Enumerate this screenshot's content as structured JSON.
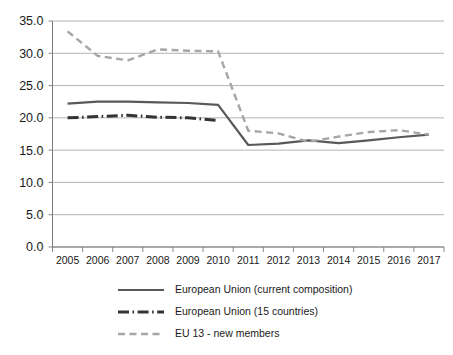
{
  "chart_data": {
    "type": "line",
    "title": "",
    "subtitle": "",
    "xlabel": "",
    "ylabel": "",
    "categories": [
      "2005",
      "2006",
      "2007",
      "2008",
      "2009",
      "2010",
      "2011",
      "2012",
      "2013",
      "2014",
      "2015",
      "2016",
      "2017"
    ],
    "x": [
      2005,
      2006,
      2007,
      2008,
      2009,
      2010,
      2011,
      2012,
      2013,
      2014,
      2015,
      2016,
      2017
    ],
    "ylim": [
      0.0,
      35.0
    ],
    "ytick_values": [
      0.0,
      5.0,
      10.0,
      15.0,
      20.0,
      25.0,
      30.0,
      35.0
    ],
    "ytick_labels": [
      "0.0",
      "5.0",
      "10.0",
      "15.0",
      "20.0",
      "25.0",
      "30.0",
      "35.0"
    ],
    "grid": true,
    "legend_position": "bottom",
    "series": [
      {
        "name": "European Union (current composition)",
        "color": "#595959",
        "style": "solid",
        "values": [
          22.2,
          22.5,
          22.5,
          22.4,
          22.3,
          22.0,
          15.8,
          16.0,
          16.5,
          16.1,
          16.5,
          17.0,
          17.4
        ]
      },
      {
        "name": "European Union (15 countries)",
        "color": "#333333",
        "style": "dash-dot",
        "values": [
          20.0,
          20.2,
          20.4,
          20.1,
          20.0,
          19.6,
          null,
          null,
          null,
          null,
          null,
          null,
          null
        ]
      },
      {
        "name": "EU 13 - new members",
        "color": "#a6a6a6",
        "style": "dashed",
        "values": [
          33.4,
          29.6,
          28.9,
          30.6,
          30.4,
          30.3,
          18.0,
          17.6,
          16.3,
          17.1,
          17.8,
          18.1,
          17.4
        ]
      }
    ]
  },
  "legend": {
    "items": [
      {
        "label": "European Union (current composition)",
        "color": "#595959",
        "style": "solid"
      },
      {
        "label": "European Union (15 countries)",
        "color": "#333333",
        "style": "dash-dot"
      },
      {
        "label": "EU 13 - new members",
        "color": "#a6a6a6",
        "style": "dashed"
      }
    ]
  },
  "axes": {
    "y_labels": [
      "35.0",
      "30.0",
      "25.0",
      "20.0",
      "15.0",
      "10.0",
      "5.0",
      "0.0"
    ],
    "x_labels": [
      "2005",
      "2006",
      "2007",
      "2008",
      "2009",
      "2010",
      "2011",
      "2012",
      "2013",
      "2014",
      "2015",
      "2016",
      "2017"
    ]
  },
  "colors": {
    "grid": "#a0a0a0",
    "axis": "#7a7a7a",
    "text": "#1a1a1a",
    "background": "#ffffff"
  }
}
